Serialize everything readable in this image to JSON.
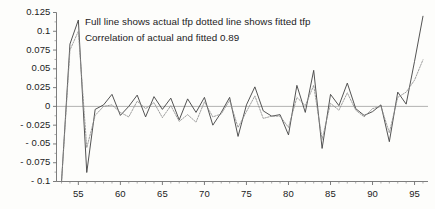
{
  "chart_data": {
    "type": "line",
    "title": "",
    "subtitle": "",
    "xlabel": "",
    "ylabel": "",
    "xlim": [
      52.4,
      96.6
    ],
    "ylim": [
      -0.1,
      0.125
    ],
    "grid": false,
    "legend_position": "none",
    "zero_line": true,
    "annotations": [
      "Full line shows actual tfp dotted line shows fitted tfp",
      "Correlation of actual and fitted 0.89"
    ],
    "correlation": 0.89,
    "xticks": [
      55,
      60,
      65,
      70,
      75,
      80,
      85,
      90,
      95
    ],
    "xtick_labels": [
      "55",
      "60",
      "65",
      "70",
      "75",
      "80",
      "85",
      "90",
      "95"
    ],
    "xminor_step": 1,
    "yticks": [
      -0.1,
      -0.075,
      -0.05,
      -0.025,
      0,
      0.025,
      0.05,
      0.075,
      0.1,
      0.125
    ],
    "ytick_labels": [
      "- 0.1",
      "- 0.075",
      "- 0.05",
      "- 0.025",
      "0",
      "0.025",
      "0.05",
      "0.075",
      "0.1",
      "0.125"
    ],
    "x": [
      53,
      54,
      55,
      56,
      57,
      58,
      59,
      60,
      61,
      62,
      63,
      64,
      65,
      66,
      67,
      68,
      69,
      70,
      71,
      72,
      73,
      74,
      75,
      76,
      77,
      78,
      79,
      80,
      81,
      82,
      83,
      84,
      85,
      86,
      87,
      88,
      89,
      90,
      91,
      92,
      93,
      94,
      95,
      96
    ],
    "series": [
      {
        "name": "actual tfp",
        "style": "solid",
        "color": "#4a4a4a",
        "values": [
          -0.1,
          0.083,
          0.115,
          -0.088,
          -0.004,
          0.002,
          0.016,
          -0.012,
          0.0,
          0.015,
          -0.014,
          0.013,
          -0.004,
          0.011,
          -0.018,
          0.01,
          -0.008,
          0.012,
          -0.025,
          -0.008,
          0.012,
          -0.04,
          0.002,
          0.026,
          -0.006,
          -0.013,
          -0.011,
          -0.038,
          0.028,
          -0.008,
          0.048,
          -0.056,
          0.016,
          0.001,
          0.031,
          -0.003,
          -0.012,
          -0.007,
          0.002,
          -0.047,
          0.019,
          0.003,
          0.06,
          0.12
        ]
      },
      {
        "name": "fitted tfp",
        "style": "dotted",
        "color": "#8c8c8c",
        "values": [
          -0.1,
          0.075,
          0.1,
          -0.055,
          -0.012,
          0.0,
          0.002,
          -0.008,
          -0.014,
          0.007,
          -0.003,
          0.005,
          -0.015,
          0.001,
          -0.02,
          -0.011,
          -0.021,
          0.006,
          -0.014,
          -0.01,
          0.008,
          -0.028,
          -0.007,
          0.014,
          -0.016,
          -0.013,
          -0.013,
          -0.028,
          0.012,
          0.001,
          0.028,
          -0.044,
          0.004,
          -0.005,
          0.018,
          -0.005,
          -0.014,
          -0.003,
          0.0,
          -0.035,
          0.012,
          0.019,
          0.035,
          0.062
        ]
      }
    ]
  }
}
